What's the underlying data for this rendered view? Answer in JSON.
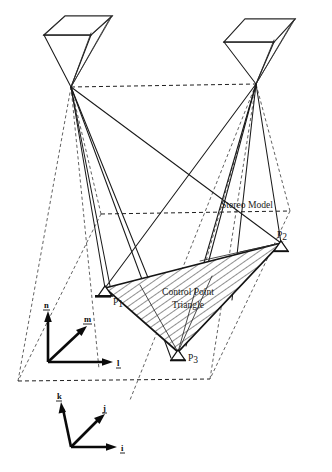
{
  "figure": {
    "type": "photogrammetry-stereo-model-diagram",
    "background_color": "#ffffff",
    "line_color": "#1a1a1a",
    "labels": {
      "stereo_model": "Stereo Model",
      "control_point_line1": "Control Point",
      "control_point_line2": "Triangle",
      "point_1_letter": "P",
      "point_1_index": "1",
      "point_2_letter": "P",
      "point_2_index": "2",
      "point_3_letter": "P",
      "point_3_index": "3"
    },
    "model_axes": {
      "name": "model-coordinate-frame",
      "vertical_axis": "n",
      "depth_axis": "m",
      "horizontal_axis": "l"
    },
    "ground_axes": {
      "name": "ground-coordinate-frame",
      "vertical_axis": "k",
      "depth_axis": "j",
      "horizontal_axis": "i"
    },
    "cameras": [
      {
        "name": "left-camera",
        "side": "left"
      },
      {
        "name": "right-camera",
        "side": "right"
      }
    ],
    "control_points": [
      {
        "id": "P1",
        "position": "left-vertex"
      },
      {
        "id": "P2",
        "position": "right-vertex"
      },
      {
        "id": "P3",
        "position": "bottom-vertex"
      }
    ]
  }
}
